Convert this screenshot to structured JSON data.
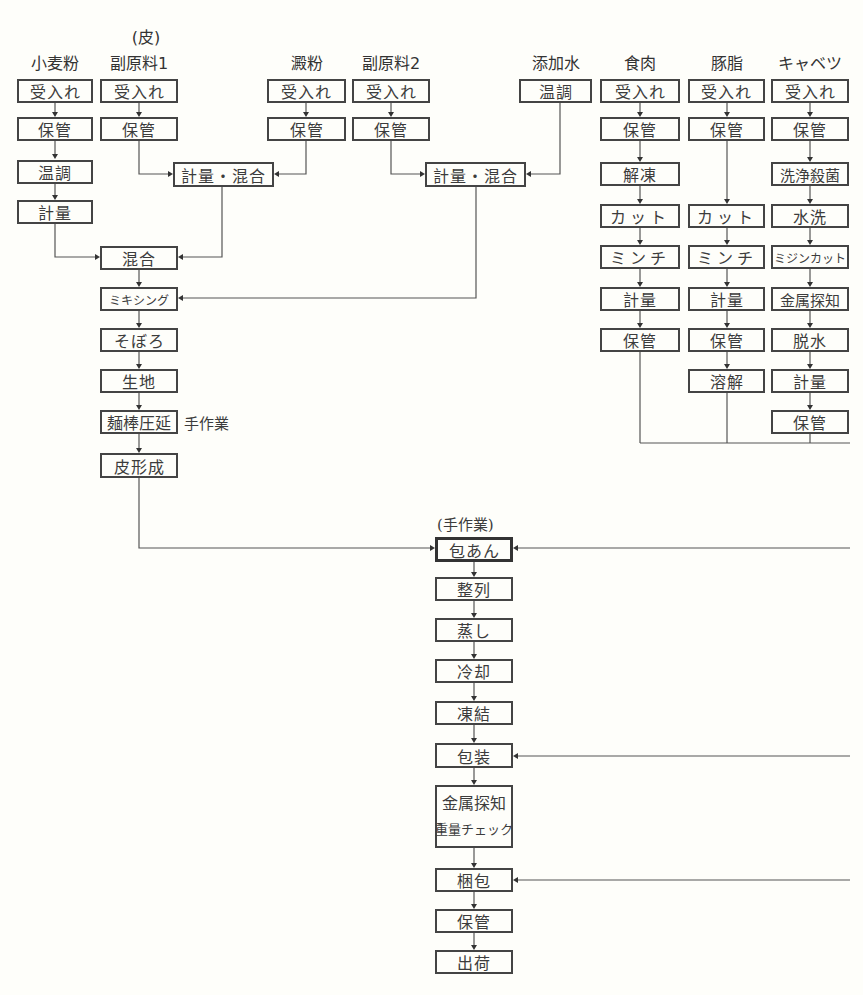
{
  "diagram": {
    "group_label": "(皮)",
    "work_note_dough": "手作業",
    "work_note_wrap": "(手作業)",
    "columns": [
      {
        "id": "wheat",
        "header": "小麦粉",
        "steps": [
          "受入れ",
          "保管",
          "温調",
          "計量"
        ]
      },
      {
        "id": "sub1",
        "header": "副原料1",
        "steps": [
          "受入れ",
          "保管"
        ]
      },
      {
        "id": "starch",
        "header": "澱粉",
        "steps": [
          "受入れ",
          "保管"
        ]
      },
      {
        "id": "sub2",
        "header": "副原料2",
        "steps": [
          "受入れ",
          "保管"
        ]
      },
      {
        "id": "water",
        "header": "添加水",
        "steps": [
          "温調"
        ]
      },
      {
        "id": "meat",
        "header": "食肉",
        "steps": [
          "受入れ",
          "保管",
          "解凍",
          "カット",
          "ミンチ",
          "計量",
          "保管"
        ]
      },
      {
        "id": "lard",
        "header": "豚脂",
        "steps": [
          "受入れ",
          "保管",
          "カット",
          "ミンチ",
          "計量",
          "保管",
          "溶解"
        ]
      },
      {
        "id": "cabbage",
        "header": "キャベツ",
        "steps": [
          "受入れ",
          "保管",
          "洗浄殺菌",
          "水洗",
          "ミジンカット",
          "金属探知",
          "脱水",
          "計量",
          "保管"
        ]
      }
    ],
    "mix1": "計量・混合",
    "mix2": "計量・混合",
    "dough_steps": [
      "混合",
      "ミキシング",
      "そぼろ",
      "生地",
      "麺棒圧延",
      "皮形成"
    ],
    "main_steps": [
      "包あん",
      "整列",
      "蒸し",
      "冷却",
      "凍結",
      "包装",
      "金属探知",
      "重量チェック",
      "梱包",
      "保管",
      "出荷"
    ]
  }
}
